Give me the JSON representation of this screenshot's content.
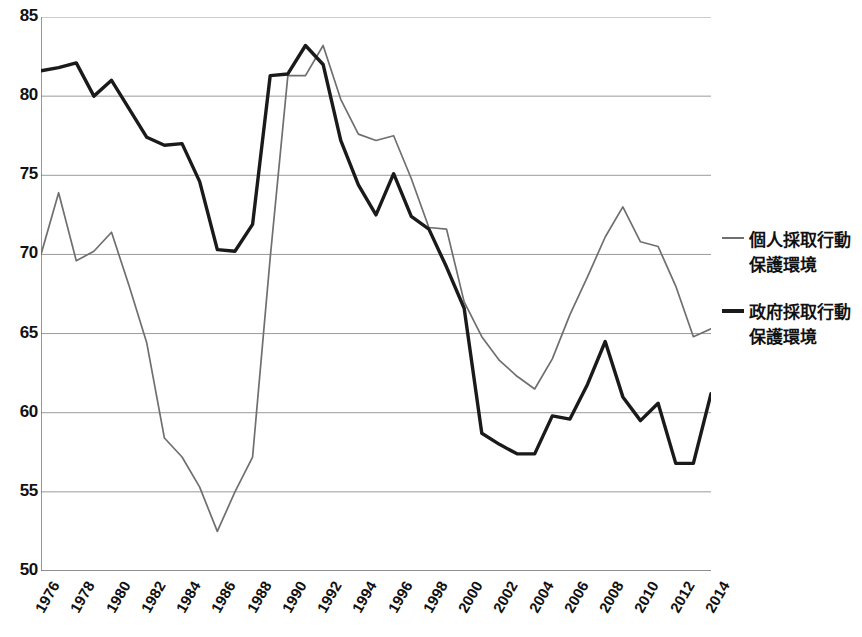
{
  "chart_data": {
    "type": "line",
    "title": "",
    "xlabel": "",
    "ylabel": "",
    "ylim": [
      50,
      85
    ],
    "ytick_step": 5,
    "yticks": [
      "85",
      "80",
      "75",
      "70",
      "65",
      "60",
      "55",
      "50"
    ],
    "grid": true,
    "legend_position": "right",
    "x": [
      1976,
      1977,
      1978,
      1979,
      1980,
      1981,
      1982,
      1983,
      1984,
      1985,
      1986,
      1987,
      1988,
      1989,
      1990,
      1991,
      1992,
      1993,
      1994,
      1995,
      1996,
      1997,
      1998,
      1999,
      2000,
      2001,
      2002,
      2003,
      2004,
      2005,
      2006,
      2007,
      2008,
      2009,
      2010,
      2011,
      2012,
      2013,
      2014
    ],
    "xticks": [
      "1976",
      "1978",
      "1980",
      "1982",
      "1984",
      "1986",
      "1988",
      "1990",
      "1992",
      "1994",
      "1996",
      "1998",
      "2000",
      "2002",
      "2004",
      "2006",
      "2008",
      "2010",
      "2012",
      "2014"
    ],
    "xtick_years": [
      1976,
      1978,
      1980,
      1982,
      1984,
      1986,
      1988,
      1990,
      1992,
      1994,
      1996,
      1998,
      2000,
      2002,
      2004,
      2006,
      2008,
      2010,
      2012,
      2014
    ],
    "series": [
      {
        "name": "個人採取行動保護環境",
        "name_line1": "個人採取行動",
        "name_line2": "保護環境",
        "color": "#6f6f6f",
        "width": 1.7,
        "values": [
          70.0,
          73.9,
          69.6,
          70.2,
          71.4,
          68.0,
          64.4,
          58.4,
          57.2,
          55.3,
          52.5,
          55.0,
          57.2,
          69.8,
          81.3,
          81.3,
          83.2,
          79.8,
          77.6,
          77.2,
          77.5,
          74.8,
          71.7,
          71.6,
          67.0,
          64.8,
          63.3,
          62.3,
          61.5,
          63.4,
          66.2,
          68.6,
          71.1,
          73.0,
          70.8,
          70.5,
          68.0,
          64.8,
          65.3
        ]
      },
      {
        "name": "政府採取行動保護環境",
        "name_line1": "政府採取行動",
        "name_line2": "保護環境",
        "color": "#1a1a1a",
        "width": 3.4,
        "values": [
          81.6,
          81.8,
          82.1,
          80.0,
          81.0,
          79.2,
          77.4,
          76.9,
          77.0,
          74.6,
          70.3,
          70.2,
          71.9,
          81.3,
          81.4,
          83.2,
          82.0,
          77.2,
          74.4,
          72.5,
          75.1,
          72.4,
          71.6,
          69.2,
          66.6,
          58.7,
          58.0,
          57.4,
          57.4,
          59.8,
          59.6,
          61.8,
          64.5,
          61.0,
          59.5,
          60.6,
          56.8,
          56.8,
          61.2
        ]
      }
    ]
  },
  "legend": {
    "entries": [
      {
        "line1": "個人採取行動",
        "line2": "保護環境"
      },
      {
        "line1": "政府採取行動",
        "line2": "保護環境"
      }
    ]
  }
}
